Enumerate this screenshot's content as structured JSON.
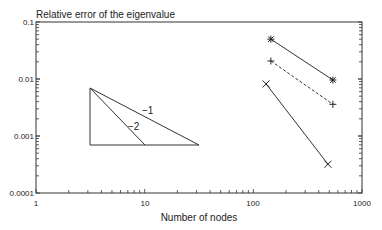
{
  "chart_data": {
    "type": "line",
    "title": "Relative error of the eigenvalue",
    "xlabel": "Number of nodes",
    "ylabel": "Relative error of the eigenvalue",
    "xscale": "log",
    "yscale": "log",
    "xlim": [
      1,
      1000
    ],
    "ylim": [
      0.0001,
      0.1
    ],
    "x_ticks": [
      "1",
      "10",
      "100",
      "1000"
    ],
    "y_ticks": [
      "0.1",
      "0.01",
      "0.001",
      "0.0001"
    ],
    "grid": false,
    "legend": null,
    "series": [
      {
        "name": "series-star",
        "marker": "star",
        "linestyle": "solid",
        "x": [
          145,
          540
        ],
        "y": [
          0.05,
          0.0096
        ]
      },
      {
        "name": "series-plus",
        "marker": "plus",
        "linestyle": "dashed",
        "x": [
          145,
          540
        ],
        "y": [
          0.0207,
          0.0036
        ]
      },
      {
        "name": "series-cross",
        "marker": "x",
        "linestyle": "solid",
        "x": [
          131,
          486
        ],
        "y": [
          0.0082,
          0.00032
        ]
      }
    ],
    "annotations": [
      {
        "type": "slope-triangle",
        "label": "-1",
        "from": [
          3.14,
          0.007
        ],
        "to": [
          31.4,
          0.0007
        ]
      },
      {
        "type": "slope-triangle",
        "label": "-2",
        "from": [
          3.14,
          0.007
        ],
        "to": [
          10,
          0.0007
        ]
      }
    ]
  },
  "labels": {
    "title": "Relative error of the eigenvalue",
    "xlabel": "Number of nodes",
    "slope1": "−1",
    "slope2": "−2",
    "xt0": "1",
    "xt1": "10",
    "xt2": "100",
    "xt3": "1000",
    "yt0": "0.1",
    "yt1": "0.01",
    "yt2": "0.001",
    "yt3": "0.0001"
  }
}
